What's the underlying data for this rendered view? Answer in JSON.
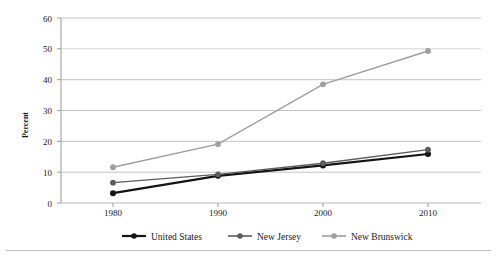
{
  "chart_data": {
    "type": "line",
    "title": "",
    "xlabel": "",
    "ylabel": "Percent",
    "categories": [
      "1980",
      "1990",
      "2000",
      "2010"
    ],
    "x": [
      1980,
      1990,
      2000,
      2010
    ],
    "ylim": [
      0,
      60
    ],
    "yticks": [
      0,
      10,
      20,
      30,
      40,
      50,
      60
    ],
    "ytick_labels": [
      "0",
      "10",
      "20",
      "30",
      "40",
      "50",
      "60"
    ],
    "grid": "horizontal",
    "legend_position": "bottom",
    "series": [
      {
        "name": "United States",
        "values": [
          3.2,
          8.8,
          12.2,
          15.9
        ],
        "color": "#141414",
        "marker": "circle"
      },
      {
        "name": "New Jersey",
        "values": [
          6.6,
          9.3,
          12.9,
          17.3
        ],
        "color": "#5c5c5c",
        "marker": "circle"
      },
      {
        "name": "New Brunswick",
        "values": [
          11.6,
          19.1,
          38.5,
          49.3
        ],
        "color": "#9e9e9e",
        "marker": "circle"
      }
    ]
  },
  "axes": {
    "y_axis_title": "Percent",
    "y_tick_0": "0",
    "y_tick_10": "10",
    "y_tick_20": "20",
    "y_tick_30": "30",
    "y_tick_40": "40",
    "y_tick_50": "50",
    "y_tick_60": "60",
    "x_tick_1980": "1980",
    "x_tick_1990": "1990",
    "x_tick_2000": "2000",
    "x_tick_2010": "2010"
  },
  "legend": {
    "entries": [
      {
        "label": "United States",
        "color": "#141414"
      },
      {
        "label": "New Jersey",
        "color": "#5c5c5c"
      },
      {
        "label": "New Brunswick",
        "color": "#9e9e9e"
      }
    ]
  },
  "colors": {
    "gridline": "#b5b5b5",
    "axis": "#9a9a9a",
    "background": "#ffffff",
    "text": "#1a1a1a",
    "footer_rule": "#bfbfbf"
  }
}
